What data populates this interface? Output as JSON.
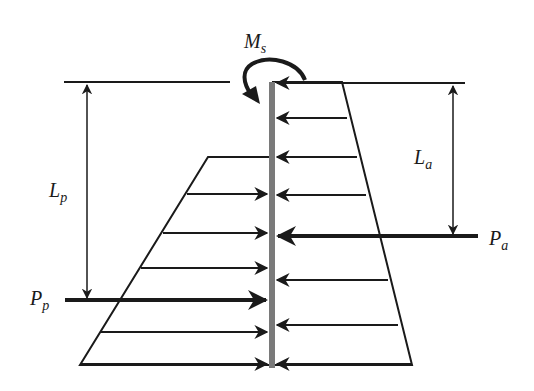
{
  "figure": {
    "labels": {
      "moment": "M",
      "moment_sub": "s",
      "active_length": "L",
      "active_length_sub": "a",
      "passive_length": "L",
      "passive_length_sub": "p",
      "active_force": "P",
      "active_force_sub": "a",
      "passive_force": "P",
      "passive_force_sub": "p"
    },
    "colors": {
      "line": "#1a1a1a",
      "wall": "#7a7a7a"
    },
    "wall": {
      "x": 272,
      "top_y": 82,
      "bottom_y": 368
    },
    "active_pressure_arrows_y": [
      83,
      118,
      157,
      195,
      280,
      325,
      363
    ],
    "active_force_y": 236,
    "passive_pressure_arrows_y": [
      157,
      194,
      233,
      268,
      330,
      362
    ],
    "passive_force_y": 300
  }
}
